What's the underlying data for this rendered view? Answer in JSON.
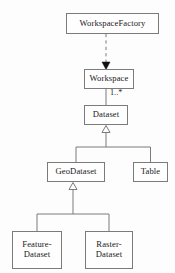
{
  "diagram": {
    "kind": "uml-class-diagram",
    "width": 175,
    "height": 273,
    "background_color": "#fdfdfd",
    "line_color": "#7b7b7b",
    "text_color": "#1a1a1a",
    "classes": [
      {
        "id": "workspace-factory",
        "name": "WorkspaceFactory",
        "x": 66,
        "y": 13,
        "width": 93,
        "height": 21,
        "font_size": 8.6
      },
      {
        "id": "workspace",
        "name": "Workspace",
        "x": 84,
        "y": 69,
        "width": 50,
        "height": 20,
        "font_size": 8.6
      },
      {
        "id": "dataset",
        "name": "Dataset",
        "x": 84,
        "y": 105,
        "width": 44,
        "height": 20,
        "font_size": 8.6
      },
      {
        "id": "geodataset",
        "name": "GeoDataset",
        "x": 47,
        "y": 162,
        "width": 58,
        "height": 20,
        "font_size": 8.6
      },
      {
        "id": "table",
        "name": "Table",
        "x": 133,
        "y": 162,
        "width": 35,
        "height": 20,
        "font_size": 8.6
      },
      {
        "id": "feature-dataset",
        "name": "Feature-\nDataset",
        "x": 12,
        "y": 231,
        "width": 50,
        "height": 38,
        "font_size": 8.6
      },
      {
        "id": "raster-dataset",
        "name": "Raster-\nDataset",
        "x": 85,
        "y": 231,
        "width": 48,
        "height": 38,
        "font_size": 8.6
      }
    ],
    "relationships": [
      {
        "id": "factory-creates-workspace",
        "type": "dependency",
        "line_style": "dashed",
        "arrowhead": "filled-triangle",
        "from": "workspace-factory",
        "to": "workspace"
      },
      {
        "id": "workspace-contains-dataset",
        "type": "association",
        "line_style": "solid",
        "arrowhead": "none",
        "from": "workspace",
        "to": "dataset",
        "multiplicity": "1..*"
      },
      {
        "id": "geodataset-inherits-dataset",
        "type": "generalization",
        "line_style": "solid",
        "arrowhead": "hollow-triangle",
        "from": "geodataset",
        "to": "dataset"
      },
      {
        "id": "table-inherits-dataset",
        "type": "generalization",
        "line_style": "solid",
        "arrowhead": "hollow-triangle",
        "from": "table",
        "to": "dataset"
      },
      {
        "id": "featuredataset-inherits-geodataset",
        "type": "generalization",
        "line_style": "solid",
        "arrowhead": "hollow-triangle",
        "from": "feature-dataset",
        "to": "geodataset"
      },
      {
        "id": "rasterdataset-inherits-geodataset",
        "type": "generalization",
        "line_style": "solid",
        "arrowhead": "hollow-triangle",
        "from": "raster-dataset",
        "to": "geodataset"
      }
    ],
    "multiplicity_labels": [
      {
        "id": "dataset-multiplicity",
        "text": "1..*",
        "x": 110,
        "y": 88,
        "font_size": 8.2
      }
    ]
  }
}
